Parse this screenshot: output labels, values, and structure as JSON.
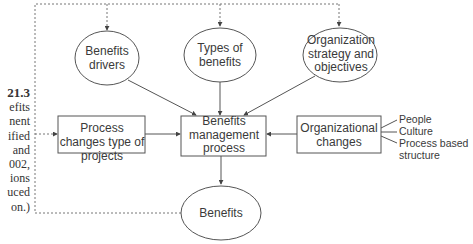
{
  "caption": {
    "figure_number": "21.3",
    "lines": [
      "efits",
      "nent",
      "ified",
      "and",
      "002,",
      "ions",
      "uced",
      "on.)"
    ]
  },
  "nodes": {
    "benefits_drivers": "Benefits drivers",
    "types_of_benefits": "Types of benefits",
    "org_strategy": "Organization strategy and objectives",
    "process_changes": "Process changes type of projects",
    "benefits_mgmt_process": "Benefits management process",
    "org_changes": "Organizational changes",
    "benefits": "Benefits"
  },
  "org_changes_items": [
    "People",
    "Culture",
    "Process based structure"
  ],
  "colors": {
    "line": "#555555",
    "text": "#3a3a3a",
    "dashed": "#777777"
  }
}
